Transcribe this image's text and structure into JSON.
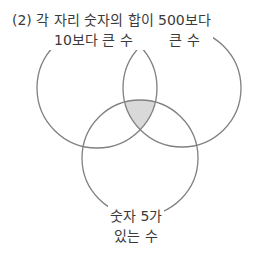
{
  "diagram": {
    "type": "venn",
    "problem_number": "(2)",
    "sets": [
      {
        "id": "A",
        "label_lines": [
          "(2) 각 자리 숫자의 합이",
          "10보다 큰 수"
        ],
        "position": "top-left",
        "circle": {
          "cx": 97,
          "cy": 88,
          "r": 60
        }
      },
      {
        "id": "B",
        "label_lines": [
          "500보다",
          "큰 수"
        ],
        "position": "top-right",
        "circle": {
          "cx": 182,
          "cy": 88,
          "r": 59
        }
      },
      {
        "id": "C",
        "label_lines": [
          "숫자 5가",
          "있는 수"
        ],
        "position": "bottom",
        "circle": {
          "cx": 140,
          "cy": 158,
          "r": 58
        }
      }
    ],
    "shaded_region": "A ∩ B ∩ C",
    "colors": {
      "stroke": "#808080",
      "shade": "#d9d9d9",
      "text": "#3a3a3a",
      "background": "#ffffff"
    }
  }
}
